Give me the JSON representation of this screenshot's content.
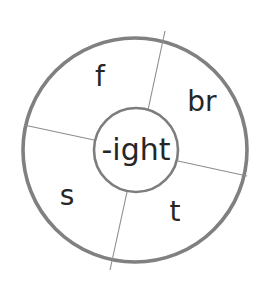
{
  "diagram": {
    "type": "word-family-wheel",
    "center": {
      "label": "-ight",
      "font_size": 30,
      "text_color": "#262626",
      "cx": 136,
      "cy": 150,
      "r": 42
    },
    "outer": {
      "cx": 135,
      "cy": 150,
      "r": 112,
      "stroke_color": "#808080",
      "stroke_width": 3.6
    },
    "inner_stroke_color": "#7d7d7d",
    "inner_stroke_width": 2.6,
    "spoke_color": "#8c8c8c",
    "spoke_width": 1.1,
    "background": "#ffffff",
    "spokes": [
      {
        "name": "spoke-top-right",
        "x1": 148,
        "y1": 110,
        "x2": 165,
        "y2": 31
      },
      {
        "name": "spoke-right",
        "x1": 178,
        "y1": 161,
        "x2": 247,
        "y2": 176
      },
      {
        "name": "spoke-bottom",
        "x1": 127,
        "y1": 192,
        "x2": 110,
        "y2": 270
      },
      {
        "name": "spoke-left",
        "x1": 94,
        "y1": 140,
        "x2": 24,
        "y2": 125
      }
    ],
    "segments": [
      {
        "name": "segment-f",
        "label": "f",
        "x": 100,
        "y": 78,
        "font_size": 28
      },
      {
        "name": "segment-br",
        "label": "br",
        "x": 202,
        "y": 103,
        "font_size": 28
      },
      {
        "name": "segment-t",
        "label": "t",
        "x": 175,
        "y": 213,
        "font_size": 28
      },
      {
        "name": "segment-s",
        "label": "s",
        "x": 67,
        "y": 197,
        "font_size": 28
      }
    ],
    "text_color": "#262626"
  }
}
